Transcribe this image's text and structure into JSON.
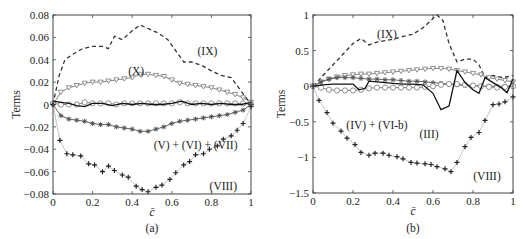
{
  "chart_data": [
    {
      "panel": "a",
      "caption": "(a)",
      "type": "line",
      "title": "",
      "xlabel": "c̄",
      "ylabel": "Terms",
      "xlim": [
        0,
        1
      ],
      "ylim": [
        -0.08,
        0.08
      ],
      "xticks": [
        0,
        0.2,
        0.4,
        0.6,
        0.8,
        1
      ],
      "xtick_labels": [
        "0",
        "0.2",
        "0.4",
        "0.6",
        "0.8",
        "1"
      ],
      "yticks": [
        -0.08,
        -0.06,
        -0.04,
        -0.02,
        0,
        0.02,
        0.04,
        0.06,
        0.08
      ],
      "ytick_labels": [
        "−0.08",
        "−0.06",
        "−0.04",
        "−0.02",
        "0",
        "0.02",
        "0.04",
        "0.06",
        "0.08"
      ],
      "grid": false,
      "legend": "none (inline annotations)",
      "series": [
        {
          "name": "(IX)",
          "style": "dashed",
          "marker": "none",
          "color": "#333333",
          "x": [
            0,
            0.03,
            0.06,
            0.1,
            0.15,
            0.2,
            0.25,
            0.28,
            0.31,
            0.35,
            0.4,
            0.44,
            0.48,
            0.53,
            0.58,
            0.62,
            0.66,
            0.7,
            0.75,
            0.8,
            0.85,
            0.9,
            0.95,
            1
          ],
          "y": [
            0,
            0.025,
            0.04,
            0.045,
            0.05,
            0.052,
            0.052,
            0.05,
            0.061,
            0.058,
            0.066,
            0.071,
            0.068,
            0.064,
            0.058,
            0.048,
            0.038,
            0.038,
            0.035,
            0.03,
            0.026,
            0.024,
            0.012,
            0
          ]
        },
        {
          "name": "(X)",
          "style": "solid",
          "marker": "triangle-down-open",
          "color": "#777777",
          "x": [
            0,
            0.04,
            0.08,
            0.12,
            0.16,
            0.2,
            0.24,
            0.28,
            0.32,
            0.36,
            0.4,
            0.44,
            0.48,
            0.52,
            0.56,
            0.6,
            0.64,
            0.68,
            0.72,
            0.76,
            0.8,
            0.84,
            0.88,
            0.92,
            0.96,
            1
          ],
          "y": [
            0,
            0.011,
            0.015,
            0.017,
            0.019,
            0.02,
            0.02,
            0.021,
            0.022,
            0.023,
            0.024,
            0.027,
            0.027,
            0.026,
            0.025,
            0.022,
            0.019,
            0.018,
            0.017,
            0.016,
            0.015,
            0.013,
            0.011,
            0.009,
            0.006,
            0.002
          ]
        },
        {
          "name": "circle-open series",
          "style": "solid",
          "marker": "circle-open",
          "color": "#777777",
          "x": [
            0,
            0.04,
            0.08,
            0.12,
            0.16,
            0.2,
            0.24,
            0.28,
            0.32,
            0.36,
            0.4,
            0.44,
            0.48,
            0.52,
            0.56,
            0.6,
            0.64,
            0.68,
            0.72,
            0.76,
            0.8,
            0.84,
            0.88,
            0.92,
            0.96,
            1
          ],
          "y": [
            0.001,
            0,
            0,
            0,
            0.002,
            0.001,
            0.001,
            0.001,
            0,
            0.001,
            0.001,
            0.001,
            0.001,
            0.001,
            0.001,
            0.001,
            0.002,
            0.001,
            0.001,
            0.001,
            0.001,
            0.001,
            0.001,
            0.001,
            0.001,
            0
          ]
        },
        {
          "name": "solid (black)",
          "style": "solid",
          "marker": "none",
          "color": "#111111",
          "x": [
            0,
            0.04,
            0.08,
            0.12,
            0.16,
            0.2,
            0.25,
            0.3,
            0.35,
            0.4,
            0.45,
            0.5,
            0.55,
            0.6,
            0.65,
            0.7,
            0.75,
            0.8,
            0.85,
            0.9,
            0.95,
            1
          ],
          "y": [
            0.003,
            0.002,
            0.001,
            -0.001,
            -0.002,
            0.001,
            0.001,
            -0.001,
            0.001,
            0,
            0.001,
            0,
            0,
            0.001,
            0.003,
            0,
            0.001,
            0,
            0.001,
            0,
            0,
            0.002
          ]
        },
        {
          "name": "(V) + (VI) + (VII)",
          "style": "solid",
          "marker": "star",
          "color": "#555555",
          "x": [
            0,
            0.04,
            0.08,
            0.12,
            0.16,
            0.2,
            0.24,
            0.28,
            0.32,
            0.36,
            0.4,
            0.44,
            0.48,
            0.52,
            0.56,
            0.6,
            0.64,
            0.68,
            0.72,
            0.76,
            0.8,
            0.84,
            0.88,
            0.92,
            0.96,
            1
          ],
          "y": [
            0,
            -0.01,
            -0.013,
            -0.014,
            -0.015,
            -0.017,
            -0.018,
            -0.018,
            -0.02,
            -0.021,
            -0.022,
            -0.024,
            -0.024,
            -0.022,
            -0.02,
            -0.017,
            -0.015,
            -0.014,
            -0.013,
            -0.012,
            -0.011,
            -0.01,
            -0.009,
            -0.007,
            -0.005,
            0
          ]
        },
        {
          "name": "(VIII)",
          "style": "solid",
          "marker": "plus",
          "color": "#999999",
          "x": [
            0,
            0.035,
            0.07,
            0.1,
            0.14,
            0.18,
            0.21,
            0.25,
            0.28,
            0.31,
            0.35,
            0.38,
            0.42,
            0.45,
            0.48,
            0.52,
            0.55,
            0.59,
            0.62,
            0.66,
            0.69,
            0.72,
            0.76,
            0.79,
            0.83,
            0.86,
            0.9,
            0.93,
            0.96,
            1
          ],
          "y": [
            0,
            -0.032,
            -0.044,
            -0.045,
            -0.046,
            -0.053,
            -0.054,
            -0.06,
            -0.055,
            -0.059,
            -0.063,
            -0.065,
            -0.073,
            -0.076,
            -0.078,
            -0.074,
            -0.072,
            -0.067,
            -0.061,
            -0.054,
            -0.051,
            -0.045,
            -0.044,
            -0.04,
            -0.037,
            -0.031,
            -0.028,
            -0.023,
            -0.017,
            -0.002
          ]
        }
      ],
      "annotations": [
        {
          "text": "(IX)",
          "x": 0.78,
          "y": 0.048
        },
        {
          "text": "(X)",
          "x": 0.42,
          "y": 0.03
        },
        {
          "text": "(V) + (VI) + (VII)",
          "x": 0.72,
          "y": -0.036
        },
        {
          "text": "(VIII)",
          "x": 0.86,
          "y": -0.073
        }
      ]
    },
    {
      "panel": "b",
      "caption": "(b)",
      "type": "line",
      "title": "",
      "xlabel": "c̄",
      "ylabel": "Terms",
      "xlim": [
        0,
        1
      ],
      "ylim": [
        -1.5,
        1
      ],
      "xticks": [
        0,
        0.2,
        0.4,
        0.6,
        0.8,
        1
      ],
      "xtick_labels": [
        "0",
        "0.2",
        "0.4",
        "0.6",
        "0.8",
        "1"
      ],
      "yticks": [
        -1.5,
        -1,
        -0.5,
        0,
        0.5,
        1
      ],
      "ytick_labels": [
        "−1.5",
        "−1",
        "−0.5",
        "0",
        "0.5",
        "1"
      ],
      "grid": false,
      "legend": "none (inline annotations)",
      "series": [
        {
          "name": "(IX)",
          "style": "dashed",
          "marker": "none",
          "color": "#333333",
          "x": [
            0,
            0.05,
            0.1,
            0.15,
            0.2,
            0.24,
            0.28,
            0.32,
            0.36,
            0.4,
            0.45,
            0.5,
            0.55,
            0.6,
            0.62,
            0.65,
            0.68,
            0.72,
            0.76,
            0.8,
            0.83,
            0.86,
            0.9,
            0.95,
            1
          ],
          "y": [
            0,
            0.15,
            0.3,
            0.45,
            0.6,
            0.67,
            0.58,
            0.62,
            0.64,
            0.66,
            0.7,
            0.73,
            0.82,
            0.95,
            1.0,
            0.92,
            0.6,
            0.34,
            0.38,
            0.38,
            0.3,
            0.12,
            0.15,
            0.12,
            0.15
          ]
        },
        {
          "name": "triangle-down-open series",
          "style": "solid",
          "marker": "triangle-down-open",
          "color": "#777777",
          "x": [
            0,
            0.04,
            0.08,
            0.12,
            0.16,
            0.2,
            0.24,
            0.28,
            0.32,
            0.36,
            0.4,
            0.44,
            0.48,
            0.52,
            0.56,
            0.6,
            0.64,
            0.68,
            0.72,
            0.76,
            0.8,
            0.84,
            0.88,
            0.92,
            0.96,
            1
          ],
          "y": [
            0,
            0.06,
            0.1,
            0.13,
            0.15,
            0.16,
            0.17,
            0.17,
            0.18,
            0.19,
            0.2,
            0.21,
            0.22,
            0.23,
            0.24,
            0.25,
            0.25,
            0.24,
            0.22,
            0.2,
            0.18,
            0.16,
            0.12,
            0.1,
            0.08,
            0.06
          ]
        },
        {
          "name": "star series",
          "style": "solid",
          "marker": "star",
          "color": "#555555",
          "x": [
            0,
            0.04,
            0.08,
            0.12,
            0.16,
            0.2,
            0.24,
            0.28,
            0.32,
            0.36,
            0.4,
            0.44,
            0.48,
            0.52,
            0.56,
            0.6,
            0.64,
            0.68,
            0.72,
            0.76,
            0.8,
            0.84,
            0.88,
            0.92,
            0.96,
            1
          ],
          "y": [
            0,
            0.06,
            0.1,
            0.12,
            0.12,
            0.12,
            0.11,
            0.1,
            0.1,
            0.09,
            0.09,
            0.08,
            0.07,
            0.07,
            0.06,
            0.05,
            0.04,
            0.03,
            0.02,
            0.01,
            0.01,
            0,
            0,
            0,
            0,
            0
          ]
        },
        {
          "name": "(IV) + (VI-b)",
          "style": "solid",
          "marker": "circle-open",
          "color": "#777777",
          "x": [
            0,
            0.04,
            0.08,
            0.12,
            0.16,
            0.2,
            0.24,
            0.28,
            0.32,
            0.36,
            0.4,
            0.44,
            0.48,
            0.52,
            0.56,
            0.6,
            0.64,
            0.68,
            0.72,
            0.76,
            0.8,
            0.84,
            0.88,
            0.92,
            0.96,
            1
          ],
          "y": [
            0,
            -0.02,
            -0.05,
            -0.06,
            -0.06,
            -0.06,
            -0.05,
            -0.03,
            -0.02,
            -0.02,
            -0.02,
            -0.02,
            -0.02,
            -0.02,
            -0.01,
            0,
            0.02,
            0.03,
            0.03,
            0.02,
            0.01,
            0,
            -0.01,
            -0.02,
            -0.01,
            0
          ]
        },
        {
          "name": "(III)",
          "style": "solid",
          "marker": "none",
          "color": "#111111",
          "x": [
            0,
            0.05,
            0.1,
            0.15,
            0.2,
            0.23,
            0.26,
            0.28,
            0.32,
            0.36,
            0.4,
            0.45,
            0.5,
            0.55,
            0.6,
            0.64,
            0.68,
            0.72,
            0.76,
            0.8,
            0.83,
            0.86,
            0.9,
            0.94,
            0.97,
            1
          ],
          "y": [
            0,
            0.02,
            0.03,
            0.03,
            0.03,
            -0.05,
            -0.03,
            0.07,
            0.06,
            0.05,
            0.04,
            0.03,
            0.03,
            0.02,
            -0.1,
            -0.33,
            -0.28,
            0.22,
            0.05,
            -0.05,
            -0.1,
            0.12,
            0.05,
            -0.02,
            -0.09,
            0.1
          ]
        },
        {
          "name": "(VIII)",
          "style": "solid",
          "marker": "plus",
          "color": "#999999",
          "x": [
            0,
            0.03,
            0.07,
            0.1,
            0.14,
            0.17,
            0.21,
            0.24,
            0.28,
            0.31,
            0.35,
            0.38,
            0.42,
            0.45,
            0.49,
            0.52,
            0.56,
            0.59,
            0.62,
            0.66,
            0.69,
            0.72,
            0.76,
            0.79,
            0.83,
            0.86,
            0.9,
            0.93,
            0.96,
            1
          ],
          "y": [
            0,
            -0.2,
            -0.37,
            -0.52,
            -0.63,
            -0.73,
            -0.82,
            -0.93,
            -0.97,
            -0.94,
            -0.94,
            -0.97,
            -0.99,
            -1.02,
            -1.07,
            -1.08,
            -1.09,
            -1.1,
            -1.13,
            -1.16,
            -1.2,
            -1.07,
            -0.85,
            -0.72,
            -0.65,
            -0.48,
            -0.26,
            -0.25,
            -0.22,
            -0.15
          ]
        }
      ],
      "annotations": [
        {
          "text": "(IX)",
          "x": 0.37,
          "y": 0.74
        },
        {
          "text": "(IV) + (VI-b)",
          "x": 0.32,
          "y": -0.55
        },
        {
          "text": "(III)",
          "x": 0.58,
          "y": -0.67
        },
        {
          "text": "(VIII)",
          "x": 0.87,
          "y": -1.26
        }
      ]
    }
  ]
}
